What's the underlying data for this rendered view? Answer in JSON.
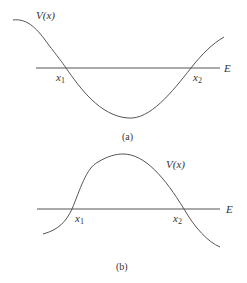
{
  "figures": [
    {
      "id": "a",
      "caption": "(a)",
      "potential_label": "V(x)",
      "energy_label": "E",
      "turning_points": [
        "x1",
        "x2"
      ],
      "shape": "potential well"
    },
    {
      "id": "b",
      "caption": "(b)",
      "potential_label": "V(x)",
      "energy_label": "E",
      "turning_points": [
        "x1",
        "x2"
      ],
      "shape": "potential barrier"
    }
  ],
  "labels": {
    "a_V": "V(x)",
    "a_E": "E",
    "a_x1": "x",
    "a_x1_sub": "1",
    "a_x2": "x",
    "a_x2_sub": "2",
    "a_caption": "(a)",
    "b_V": "V(x)",
    "b_E": "E",
    "b_x1": "x",
    "b_x1_sub": "1",
    "b_x2": "x",
    "b_x2_sub": "2",
    "b_caption": "(b)"
  },
  "colors": {
    "line": "#555555",
    "text": "#333333"
  }
}
